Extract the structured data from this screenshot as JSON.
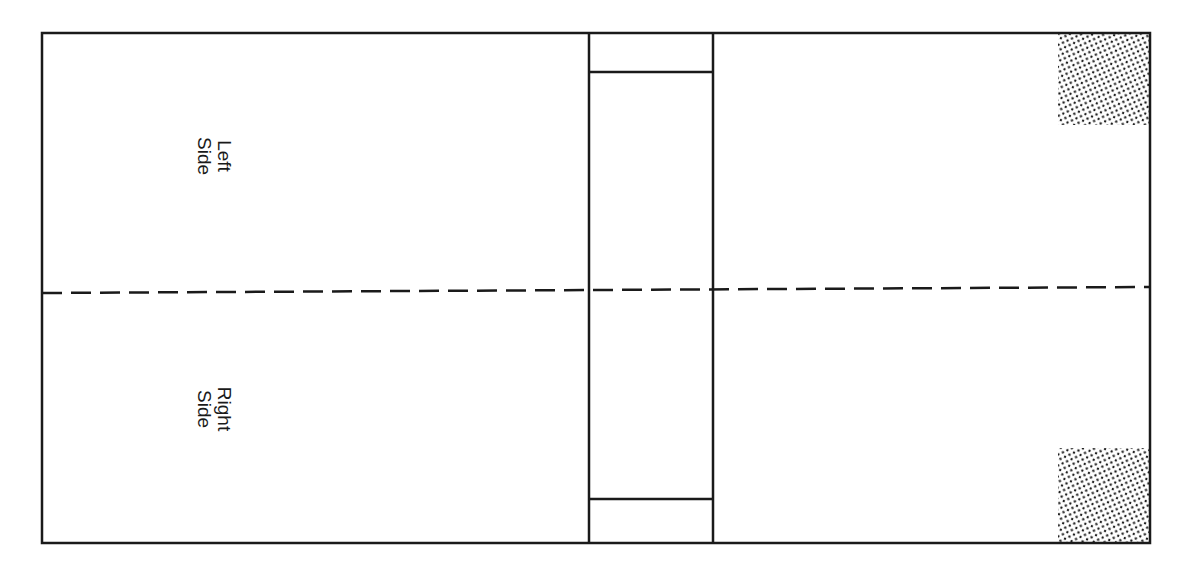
{
  "diagram": {
    "type": "book-cover-layout",
    "colors": {
      "line": "#1a1a1a",
      "background": "#ffffff",
      "shading_dots": "#1a1a1a"
    },
    "outer_box": {
      "x": 42,
      "y": 33,
      "width": 1108,
      "height": 510
    },
    "spine": {
      "left_x": 589,
      "right_x": 713,
      "top_band_y": 72,
      "bottom_band_y": 499
    },
    "fold_line": {
      "style": "dashed",
      "y_left": 293,
      "y_right": 287
    },
    "shaded_regions": [
      {
        "name": "top-right-corner",
        "x": 1058,
        "y": 33,
        "width": 92,
        "height": 92
      },
      {
        "name": "bottom-right-corner",
        "x": 1058,
        "y": 448,
        "width": 92,
        "height": 95
      }
    ],
    "labels": {
      "top": {
        "line1": "Left",
        "line2": "Side"
      },
      "bottom": {
        "line1": "Right",
        "line2": "Side"
      }
    }
  }
}
